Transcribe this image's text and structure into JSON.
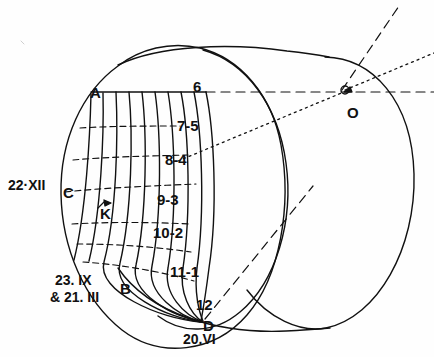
{
  "figure": {
    "ink_color": "#111111",
    "background_color": "#fefefe"
  },
  "points": [
    {
      "id": "A",
      "label": "A",
      "x": 90,
      "y": 92
    },
    {
      "id": "C",
      "label": "C",
      "x": 63,
      "y": 192
    },
    {
      "id": "B",
      "label": "B",
      "x": 120,
      "y": 288
    },
    {
      "id": "D",
      "label": "D",
      "x": 203,
      "y": 325
    },
    {
      "id": "K",
      "label": "K",
      "x": 100,
      "y": 213
    },
    {
      "id": "O",
      "label": "O",
      "x": 347,
      "y": 112
    }
  ],
  "hour_lines": [
    {
      "label": "6",
      "x": 193,
      "y": 86
    },
    {
      "label": "7-5",
      "x": 177,
      "y": 125
    },
    {
      "label": "8-4",
      "x": 165,
      "y": 159
    },
    {
      "label": "9-3",
      "x": 157,
      "y": 199
    },
    {
      "label": "10-2",
      "x": 153,
      "y": 232
    },
    {
      "label": "11-1",
      "x": 170,
      "y": 271
    },
    {
      "label": "12",
      "x": 196,
      "y": 304
    }
  ],
  "date_lines": [
    {
      "label": "22·XII",
      "x": 8,
      "y": 185
    },
    {
      "label": "23. IX",
      "x": 55,
      "y": 280
    },
    {
      "label": "& 21. III",
      "x": 50,
      "y": 297
    },
    {
      "label": "20.VI",
      "x": 183,
      "y": 339
    }
  ],
  "construction_rays": [
    {
      "name": "horizontal-axis-ray",
      "style": "dashed",
      "from": "A",
      "through": "O"
    },
    {
      "name": "upper-dashed-ray",
      "style": "dashed",
      "from": "O",
      "to": "top-right"
    },
    {
      "name": "upper-dotted-ray",
      "style": "dotted",
      "from": "O",
      "to": "right-edge"
    },
    {
      "name": "gnomon-dotted-ray",
      "style": "dotted",
      "from": "8-4",
      "to": "O"
    },
    {
      "name": "gnomon-dashed-ray",
      "style": "dashed",
      "from": "D",
      "to": "O"
    }
  ]
}
